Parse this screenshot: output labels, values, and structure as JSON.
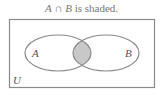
{
  "title": {
    "set_a": "A",
    "operator": "∩",
    "set_b": "B",
    "suffix": "is shaded."
  },
  "diagram": {
    "universe_label": "U",
    "circle_a_label": "A",
    "circle_b_label": "B",
    "shaded_region": "A ∩ B",
    "colors": {
      "outline": "#8a8a8a",
      "shade": "#c8c8c8",
      "text": "#555555"
    }
  }
}
